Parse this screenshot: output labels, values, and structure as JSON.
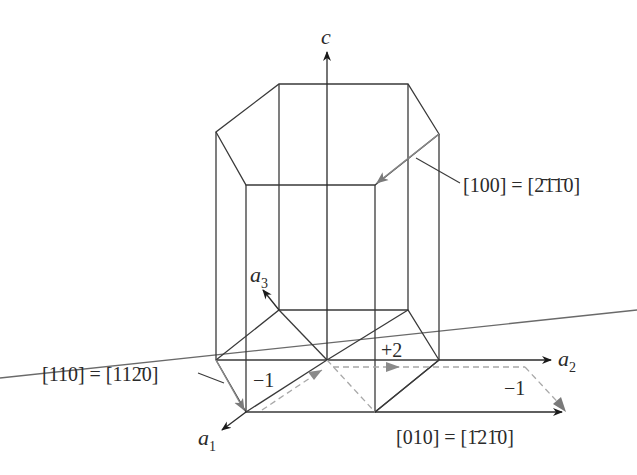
{
  "diagram": {
    "type": "hexagonal-prism-crystal-directions",
    "axes": {
      "c": "c",
      "a1": "a",
      "a1_sub": "1",
      "a2": "a",
      "a2_sub": "2",
      "a3": "a",
      "a3_sub": "3"
    },
    "direction_labels": {
      "d100": "[100] = [2̄1̄1̄0]",
      "d110": "[110] = [112̄0]",
      "d010": "[010] = [1̄21̄0]"
    },
    "component_labels": {
      "minus1_left": "−1",
      "plus2": "+2",
      "minus1_right": "−1"
    },
    "colors": {
      "line": "#3a3a3a",
      "gray_arrow": "#8a8a8a",
      "dashed": "#a8a8a8",
      "background": "#ffffff"
    }
  }
}
